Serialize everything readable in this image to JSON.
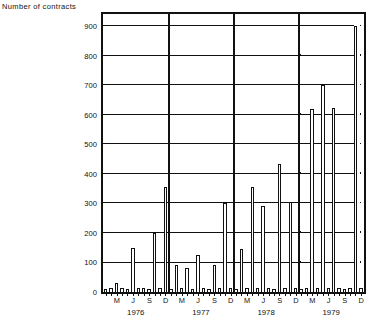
{
  "chart_data": {
    "type": "bar",
    "title": "Number of contracts",
    "xlabel": "",
    "ylabel": "Number of contracts",
    "ylim": [
      0,
      900
    ],
    "ytick_labels": [
      "0",
      "100",
      "200",
      "300",
      "400",
      "500",
      "600",
      "700",
      "800",
      "900"
    ],
    "ytick_values": [
      0,
      100,
      200,
      300,
      400,
      500,
      600,
      700,
      800,
      900
    ],
    "grid": "horizontal",
    "legend": "none",
    "year_groups": [
      "1976",
      "1977",
      "1978",
      "1979"
    ],
    "month_ticks": [
      "M",
      "J",
      "S",
      "D"
    ],
    "categories": [
      "1976-01",
      "1976-02",
      "1976-03",
      "1976-04",
      "1976-05",
      "1976-06",
      "1976-07",
      "1976-08",
      "1976-09",
      "1976-10",
      "1976-11",
      "1976-12",
      "1977-01",
      "1977-02",
      "1977-03",
      "1977-04",
      "1977-05",
      "1977-06",
      "1977-07",
      "1977-08",
      "1977-09",
      "1977-10",
      "1977-11",
      "1977-12",
      "1978-01",
      "1978-02",
      "1978-03",
      "1978-04",
      "1978-05",
      "1978-06",
      "1978-07",
      "1978-08",
      "1978-09",
      "1978-10",
      "1978-11",
      "1978-12",
      "1979-01",
      "1979-02",
      "1979-03",
      "1979-04",
      "1979-05",
      "1979-06",
      "1979-07",
      "1979-08",
      "1979-09",
      "1979-10",
      "1979-11",
      "1979-12"
    ],
    "values": [
      10,
      12,
      30,
      14,
      10,
      150,
      12,
      14,
      10,
      200,
      12,
      355,
      10,
      90,
      12,
      80,
      10,
      125,
      12,
      10,
      90,
      12,
      300,
      14,
      10,
      145,
      12,
      355,
      14,
      290,
      12,
      10,
      435,
      12,
      305,
      14,
      10,
      12,
      620,
      14,
      700,
      12,
      625,
      14,
      10,
      12,
      900,
      14
    ]
  }
}
